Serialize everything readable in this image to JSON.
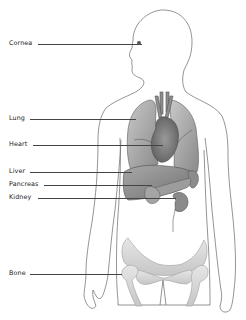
{
  "diagram": {
    "type": "anatomical-organ-locations",
    "colors": {
      "outline": "#666666",
      "organ_fill": "#9a9a9a",
      "organ_dark": "#6e6e6e",
      "bone_fill": "#d9d9d9",
      "label_text": "#222222",
      "leader_line": "#444444"
    },
    "labels": [
      {
        "id": "cornea",
        "text": "Cornea"
      },
      {
        "id": "lung",
        "text": "Lung"
      },
      {
        "id": "heart",
        "text": "Heart"
      },
      {
        "id": "liver",
        "text": "Liver"
      },
      {
        "id": "pancreas",
        "text": "Pancreas"
      },
      {
        "id": "kidney",
        "text": "Kidney"
      },
      {
        "id": "bone",
        "text": "Bone"
      }
    ]
  }
}
